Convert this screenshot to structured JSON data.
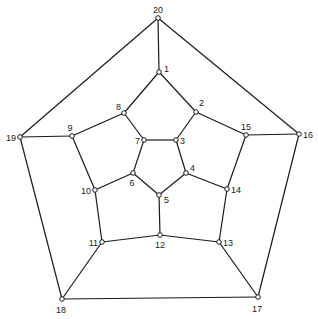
{
  "diagram": {
    "type": "graph",
    "nodes": [
      {
        "id": "1",
        "x": 159,
        "y": 72,
        "lx": 164,
        "ly": 72,
        "anchor": "start"
      },
      {
        "id": "2",
        "x": 196,
        "y": 112,
        "lx": 199,
        "ly": 106,
        "anchor": "start"
      },
      {
        "id": "3",
        "x": 176,
        "y": 140,
        "lx": 180,
        "ly": 144,
        "anchor": "start"
      },
      {
        "id": "4",
        "x": 186,
        "y": 173,
        "lx": 190,
        "ly": 171,
        "anchor": "start"
      },
      {
        "id": "5",
        "x": 159,
        "y": 195,
        "lx": 164,
        "ly": 203,
        "anchor": "start"
      },
      {
        "id": "6",
        "x": 133,
        "y": 173,
        "lx": 132,
        "ly": 186,
        "anchor": "middle"
      },
      {
        "id": "7",
        "x": 144,
        "y": 140,
        "lx": 140,
        "ly": 144,
        "anchor": "end"
      },
      {
        "id": "8",
        "x": 124,
        "y": 113,
        "lx": 121,
        "ly": 110,
        "anchor": "end"
      },
      {
        "id": "9",
        "x": 72,
        "y": 136,
        "lx": 70,
        "ly": 131,
        "anchor": "middle"
      },
      {
        "id": "10",
        "x": 95,
        "y": 190,
        "lx": 91,
        "ly": 194,
        "anchor": "end"
      },
      {
        "id": "11",
        "x": 102,
        "y": 242,
        "lx": 98,
        "ly": 246,
        "anchor": "end"
      },
      {
        "id": "12",
        "x": 160,
        "y": 235,
        "lx": 160,
        "ly": 248,
        "anchor": "middle"
      },
      {
        "id": "13",
        "x": 219,
        "y": 242,
        "lx": 223,
        "ly": 246,
        "anchor": "start"
      },
      {
        "id": "14",
        "x": 227,
        "y": 189,
        "lx": 231,
        "ly": 193,
        "anchor": "start"
      },
      {
        "id": "15",
        "x": 246,
        "y": 135,
        "lx": 246,
        "ly": 130,
        "anchor": "middle"
      },
      {
        "id": "16",
        "x": 299,
        "y": 134,
        "lx": 303,
        "ly": 138,
        "anchor": "start"
      },
      {
        "id": "17",
        "x": 258,
        "y": 297,
        "lx": 257,
        "ly": 312,
        "anchor": "middle"
      },
      {
        "id": "18",
        "x": 62,
        "y": 299,
        "lx": 61,
        "ly": 313,
        "anchor": "middle"
      },
      {
        "id": "19",
        "x": 20,
        "y": 137,
        "lx": 16,
        "ly": 141,
        "anchor": "end"
      },
      {
        "id": "20",
        "x": 158,
        "y": 18,
        "lx": 158,
        "ly": 13,
        "anchor": "middle"
      }
    ],
    "edges": [
      [
        "20",
        "1"
      ],
      [
        "20",
        "19"
      ],
      [
        "20",
        "16"
      ],
      [
        "1",
        "8"
      ],
      [
        "1",
        "2"
      ],
      [
        "2",
        "3"
      ],
      [
        "2",
        "15"
      ],
      [
        "3",
        "7"
      ],
      [
        "3",
        "4"
      ],
      [
        "4",
        "5"
      ],
      [
        "4",
        "14"
      ],
      [
        "5",
        "6"
      ],
      [
        "5",
        "12"
      ],
      [
        "6",
        "7"
      ],
      [
        "6",
        "10"
      ],
      [
        "7",
        "8"
      ],
      [
        "8",
        "9"
      ],
      [
        "9",
        "19"
      ],
      [
        "9",
        "10"
      ],
      [
        "10",
        "11"
      ],
      [
        "11",
        "12"
      ],
      [
        "11",
        "18"
      ],
      [
        "12",
        "13"
      ],
      [
        "13",
        "14"
      ],
      [
        "13",
        "17"
      ],
      [
        "14",
        "15"
      ],
      [
        "15",
        "16"
      ],
      [
        "16",
        "17"
      ],
      [
        "17",
        "18"
      ],
      [
        "18",
        "19"
      ]
    ]
  }
}
